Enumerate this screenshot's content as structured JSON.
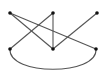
{
  "diagram": {
    "type": "graph",
    "width": 111,
    "height": 78,
    "colors": {
      "background": "#ffffff",
      "edge": "#555555",
      "node": "#111111"
    },
    "node_radius": 1.8,
    "edge_width": 1.1,
    "nodes": [
      {
        "id": "n1",
        "x": 10,
        "y": 13
      },
      {
        "id": "n2",
        "x": 53,
        "y": 13
      },
      {
        "id": "n3",
        "x": 97,
        "y": 13
      },
      {
        "id": "n4",
        "x": 10,
        "y": 49
      },
      {
        "id": "n5",
        "x": 53,
        "y": 49
      },
      {
        "id": "n6",
        "x": 96,
        "y": 49
      }
    ],
    "edges": [
      {
        "from": "n1",
        "to": "n5",
        "kind": "line"
      },
      {
        "from": "n1",
        "to": "n6",
        "kind": "line"
      },
      {
        "from": "n2",
        "to": "n4",
        "kind": "line"
      },
      {
        "from": "n2",
        "to": "n5",
        "kind": "line"
      },
      {
        "from": "n3",
        "to": "n5",
        "kind": "line"
      },
      {
        "from": "n4",
        "to": "n6",
        "kind": "arc",
        "sag": 27
      }
    ]
  }
}
